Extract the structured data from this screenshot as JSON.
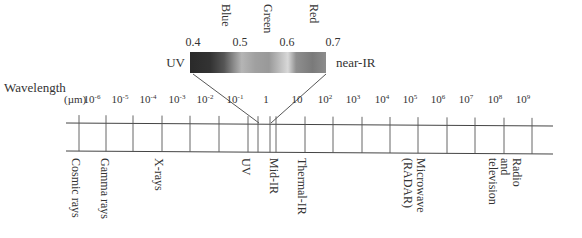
{
  "diagram": {
    "title": "Wavelength",
    "unit": "(µm)",
    "scale_ticks": [
      {
        "base": "10",
        "exp": "-6",
        "x": 92
      },
      {
        "base": "10",
        "exp": "-5",
        "x": 120
      },
      {
        "base": "10",
        "exp": "-4",
        "x": 148
      },
      {
        "base": "10",
        "exp": "-3",
        "x": 177
      },
      {
        "base": "10",
        "exp": "-2",
        "x": 205
      },
      {
        "base": "10",
        "exp": "-1",
        "x": 235
      },
      {
        "base": "1",
        "exp": "",
        "x": 266
      },
      {
        "base": "10",
        "exp": "",
        "x": 297
      },
      {
        "base": "10",
        "exp": "2",
        "x": 325
      },
      {
        "base": "10",
        "exp": "3",
        "x": 353
      },
      {
        "base": "10",
        "exp": "4",
        "x": 382
      },
      {
        "base": "10",
        "exp": "5",
        "x": 410
      },
      {
        "base": "10",
        "exp": "6",
        "x": 438
      },
      {
        "base": "10",
        "exp": "7",
        "x": 466
      },
      {
        "base": "10",
        "exp": "8",
        "x": 495
      },
      {
        "base": "10",
        "exp": "9",
        "x": 523
      }
    ],
    "band_lines_x": [
      79,
      106,
      133,
      162,
      190,
      219,
      248,
      258,
      270,
      276,
      305,
      333,
      362,
      390,
      418,
      447,
      475,
      504,
      532
    ],
    "bands": [
      {
        "label": "Cosmic rays",
        "x": 72
      },
      {
        "label": "Gamma rays",
        "x": 101
      },
      {
        "label": "X-rays",
        "x": 155
      },
      {
        "label": "UV",
        "x": 242
      },
      {
        "label": "Mid-IR",
        "x": 270
      },
      {
        "label": "Thermal-IR",
        "x": 298
      },
      {
        "label": "Microwave",
        "x": 417
      },
      {
        "label": "(RADAR)",
        "x": 404
      },
      {
        "label": "Radio",
        "x": 513
      },
      {
        "label": "and",
        "x": 501
      },
      {
        "label": "television",
        "x": 489
      }
    ],
    "visible_spectrum": {
      "left_label": "UV",
      "right_label": "near-IR",
      "wavelengths": [
        {
          "value": "0.4",
          "x": 193
        },
        {
          "value": "0.5",
          "x": 240
        },
        {
          "value": "0.6",
          "x": 287
        },
        {
          "value": "0.7",
          "x": 333
        }
      ],
      "colors": [
        {
          "name": "Blue",
          "x": 222
        },
        {
          "name": "Green",
          "x": 264
        },
        {
          "name": "Red",
          "x": 310
        }
      ],
      "gradient_stops": [
        {
          "offset": "0%",
          "color": "#2a2a2a"
        },
        {
          "offset": "15%",
          "color": "#333333"
        },
        {
          "offset": "25%",
          "color": "#555555"
        },
        {
          "offset": "32%",
          "color": "#8a8a8a"
        },
        {
          "offset": "38%",
          "color": "#b5b5b5"
        },
        {
          "offset": "48%",
          "color": "#a0a0a0"
        },
        {
          "offset": "58%",
          "color": "#999999"
        },
        {
          "offset": "66%",
          "color": "#bdbdbd"
        },
        {
          "offset": "72%",
          "color": "#d8d8d8"
        },
        {
          "offset": "78%",
          "color": "#8f8f8f"
        },
        {
          "offset": "90%",
          "color": "#7a7a7a"
        },
        {
          "offset": "100%",
          "color": "#8c8c8c"
        }
      ]
    }
  }
}
